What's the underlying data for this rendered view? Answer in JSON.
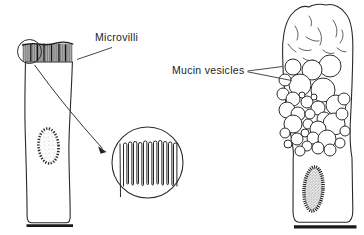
{
  "figure": {
    "type": "biology-line-diagram",
    "background": "#ffffff",
    "ink": "#222222",
    "labels": {
      "microvilli": "Microvilli",
      "mucin_vesicles": "Mucin vesicles"
    }
  }
}
